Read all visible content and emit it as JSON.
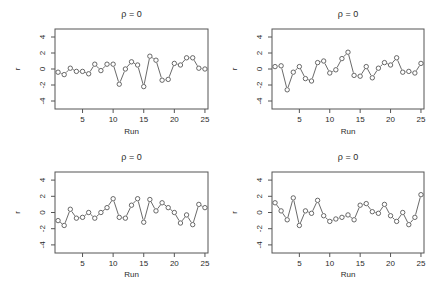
{
  "chart_data": [
    {
      "type": "line",
      "panel": "top-left",
      "title": "ρ = 0",
      "xlabel": "Run",
      "ylabel": "r",
      "xlim": [
        0.5,
        25.5
      ],
      "ylim": [
        -5,
        5
      ],
      "xticks": [
        5,
        10,
        15,
        20,
        25
      ],
      "yticks": [
        -4,
        -2,
        0,
        2,
        4
      ],
      "grid": false,
      "markers": "open-circle",
      "x": [
        1,
        2,
        3,
        4,
        5,
        6,
        7,
        8,
        9,
        10,
        11,
        12,
        13,
        14,
        15,
        16,
        17,
        18,
        19,
        20,
        21,
        22,
        23,
        24,
        25
      ],
      "values": [
        -0.4,
        -0.7,
        0.1,
        -0.3,
        -0.3,
        -0.6,
        0.6,
        -0.2,
        0.6,
        0.6,
        -1.9,
        0.0,
        0.9,
        0.5,
        -2.2,
        1.6,
        1.1,
        -1.4,
        -1.3,
        0.7,
        0.5,
        1.4,
        1.4,
        0.1,
        0.0
      ]
    },
    {
      "type": "line",
      "panel": "top-right",
      "title": "ρ = 0",
      "xlabel": "Run",
      "ylabel": "r",
      "xlim": [
        0.5,
        25.5
      ],
      "ylim": [
        -5,
        5
      ],
      "xticks": [
        5,
        10,
        15,
        20,
        25
      ],
      "yticks": [
        -4,
        -2,
        0,
        2,
        4
      ],
      "grid": false,
      "markers": "open-circle",
      "x": [
        1,
        2,
        3,
        4,
        5,
        6,
        7,
        8,
        9,
        10,
        11,
        12,
        13,
        14,
        15,
        16,
        17,
        18,
        19,
        20,
        21,
        22,
        23,
        24,
        25
      ],
      "values": [
        0.3,
        0.4,
        -2.6,
        -0.4,
        0.3,
        -1.2,
        -1.5,
        0.8,
        1.0,
        -0.5,
        -0.1,
        1.3,
        2.1,
        -0.8,
        -0.9,
        0.3,
        -1.1,
        0.1,
        0.8,
        0.5,
        1.4,
        -0.4,
        -0.3,
        -0.5,
        0.7
      ]
    },
    {
      "type": "line",
      "panel": "bottom-left",
      "title": "ρ = 0",
      "xlabel": "Run",
      "ylabel": "r",
      "xlim": [
        0.5,
        25.5
      ],
      "ylim": [
        -5,
        5
      ],
      "xticks": [
        5,
        10,
        15,
        20,
        25
      ],
      "yticks": [
        -4,
        -2,
        0,
        2,
        4
      ],
      "grid": false,
      "markers": "open-circle",
      "x": [
        1,
        2,
        3,
        4,
        5,
        6,
        7,
        8,
        9,
        10,
        11,
        12,
        13,
        14,
        15,
        16,
        17,
        18,
        19,
        20,
        21,
        22,
        23,
        24,
        25
      ],
      "values": [
        -1.0,
        -1.6,
        0.4,
        -0.7,
        -0.6,
        0.0,
        -0.7,
        0.0,
        0.6,
        1.7,
        -0.6,
        -0.7,
        0.9,
        1.7,
        -1.2,
        1.6,
        0.2,
        1.2,
        0.6,
        0.0,
        -1.3,
        -0.3,
        -1.5,
        1.0,
        0.6
      ]
    },
    {
      "type": "line",
      "panel": "bottom-right",
      "title": "ρ = 0",
      "xlabel": "Run",
      "ylabel": "r",
      "xlim": [
        0.5,
        25.5
      ],
      "ylim": [
        -5,
        5
      ],
      "xticks": [
        5,
        10,
        15,
        20,
        25
      ],
      "yticks": [
        -4,
        -2,
        0,
        2,
        4
      ],
      "grid": false,
      "markers": "open-circle",
      "x": [
        1,
        2,
        3,
        4,
        5,
        6,
        7,
        8,
        9,
        10,
        11,
        12,
        13,
        14,
        15,
        16,
        17,
        18,
        19,
        20,
        21,
        22,
        23,
        24,
        25
      ],
      "values": [
        1.2,
        0.2,
        -0.9,
        1.8,
        -1.6,
        0.2,
        -0.1,
        1.5,
        -0.4,
        -1.1,
        -0.8,
        -0.6,
        -0.3,
        -0.9,
        0.9,
        1.1,
        0.1,
        -0.1,
        1.0,
        -0.4,
        -1.1,
        0.0,
        -1.5,
        -0.6,
        2.2
      ]
    }
  ]
}
